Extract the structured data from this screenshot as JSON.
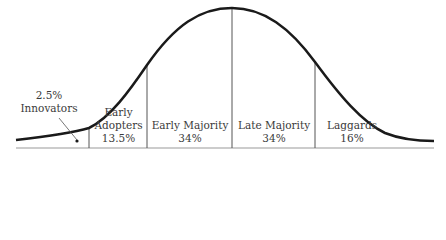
{
  "diagram": {
    "type": "diffusion-of-innovations-bell-curve",
    "colors": {
      "curve": "#1a1a1a",
      "divider": "#555555",
      "baseline": "#999999",
      "text": "#3a3a3a"
    },
    "segments": [
      {
        "name": "Innovators",
        "percent": "2.5%"
      },
      {
        "name": "Early Adopters",
        "name_line1": "Early",
        "name_line2": "Adopters",
        "percent": "13.5%"
      },
      {
        "name": "Early Majority",
        "percent": "34%"
      },
      {
        "name": "Late Majority",
        "percent": "34%"
      },
      {
        "name": "Laggards",
        "percent": "16%"
      }
    ]
  }
}
